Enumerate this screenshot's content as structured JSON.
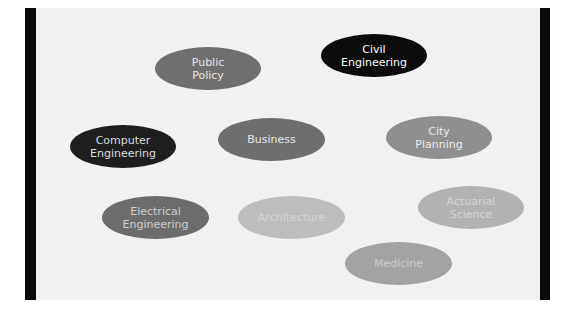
{
  "diagram": {
    "bubbles": [
      {
        "id": "public-policy",
        "lines": [
          "Public",
          "Policy"
        ],
        "bg": "#6f6f6f",
        "fg": "#e6e6e6",
        "x": 155,
        "y": 47,
        "w": 106,
        "h": 43
      },
      {
        "id": "civil-engineering",
        "lines": [
          "Civil",
          "Engineering"
        ],
        "bg": "#0b0b0b",
        "fg": "#ffffff",
        "x": 321,
        "y": 34,
        "w": 106,
        "h": 43
      },
      {
        "id": "computer-engineering",
        "lines": [
          "Computer",
          "Engineering"
        ],
        "bg": "#1e1e1e",
        "fg": "#dcdcdc",
        "x": 70,
        "y": 125,
        "w": 106,
        "h": 43
      },
      {
        "id": "business",
        "lines": [
          "Business"
        ],
        "bg": "#6e6e6e",
        "fg": "#e6e6e6",
        "x": 218,
        "y": 118,
        "w": 107,
        "h": 43
      },
      {
        "id": "city-planning",
        "lines": [
          "City",
          "Planning"
        ],
        "bg": "#8f8f8f",
        "fg": "#ececec",
        "x": 386,
        "y": 116,
        "w": 106,
        "h": 43
      },
      {
        "id": "electrical-engineering",
        "lines": [
          "Electrical",
          "Engineering"
        ],
        "bg": "#6c6c6c",
        "fg": "#cfcfcf",
        "x": 102,
        "y": 196,
        "w": 107,
        "h": 43
      },
      {
        "id": "architecture",
        "lines": [
          "Architecture"
        ],
        "bg": "#bdbdbd",
        "fg": "#d6d6d6",
        "x": 238,
        "y": 196,
        "w": 107,
        "h": 43
      },
      {
        "id": "actuarial-science",
        "lines": [
          "Actuarial",
          "Science"
        ],
        "bg": "#b2b2b2",
        "fg": "#d6d6d6",
        "x": 418,
        "y": 186,
        "w": 106,
        "h": 43
      },
      {
        "id": "medicine",
        "lines": [
          "Medicine"
        ],
        "bg": "#a3a3a3",
        "fg": "#cdcdcd",
        "x": 345,
        "y": 242,
        "w": 107,
        "h": 43
      }
    ]
  }
}
